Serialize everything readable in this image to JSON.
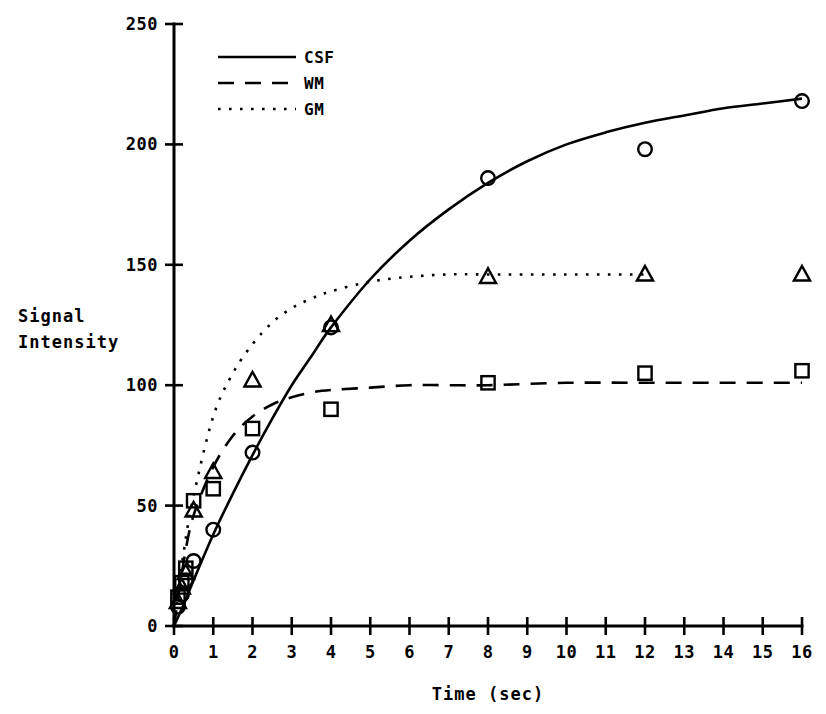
{
  "chart_data": {
    "type": "line",
    "title": "",
    "xlabel": "Time (sec)",
    "ylabel": "Signal\nIntensity",
    "ylabel_line1": "Signal",
    "ylabel_line2": "Intensity",
    "xlim": [
      0,
      16
    ],
    "ylim": [
      0,
      250
    ],
    "xticks": [
      0,
      1,
      2,
      3,
      4,
      5,
      6,
      7,
      8,
      9,
      10,
      11,
      12,
      13,
      14,
      15,
      16
    ],
    "xtick_labels": [
      "0",
      "1",
      "2",
      "3",
      "4",
      "5",
      "6",
      "7",
      "8",
      "9",
      "10",
      "11",
      "12",
      "13",
      "14",
      "15",
      "16"
    ],
    "yticks": [
      0,
      50,
      100,
      150,
      200,
      250
    ],
    "ytick_labels": [
      "0",
      "50",
      "100",
      "150",
      "200",
      "250"
    ],
    "grid": false,
    "legend_position": "upper left",
    "series": [
      {
        "name": "CSF",
        "linestyle": "solid",
        "marker": "circle",
        "color": "#000000",
        "x": [
          0.1,
          0.2,
          0.3,
          0.5,
          1.0,
          2.0,
          4.0,
          8.0,
          12.0,
          16.0
        ],
        "y": [
          8,
          13,
          19,
          27,
          40,
          72,
          124,
          186,
          198,
          218
        ],
        "fit_x": [
          0,
          0.25,
          0.5,
          1,
          1.5,
          2,
          2.5,
          3,
          3.5,
          4,
          5,
          6,
          7,
          8,
          9,
          10,
          11,
          12,
          13,
          14,
          15,
          16
        ],
        "fit_y": [
          0,
          9,
          19,
          38,
          55,
          71,
          86,
          100,
          112,
          124,
          144,
          160,
          173,
          184,
          193,
          200,
          205,
          209,
          212,
          215,
          217,
          219
        ]
      },
      {
        "name": "WM",
        "linestyle": "dashed",
        "marker": "square",
        "color": "#000000",
        "x": [
          0.1,
          0.2,
          0.3,
          0.5,
          1.0,
          2.0,
          4.0,
          8.0,
          12.0,
          16.0
        ],
        "y": [
          12,
          18,
          24,
          52,
          57,
          82,
          90,
          101,
          105,
          106
        ],
        "fit_x": [
          0,
          0.25,
          0.5,
          1,
          1.5,
          2,
          2.5,
          3,
          3.5,
          4,
          5,
          6,
          7,
          8,
          10,
          12,
          14,
          16
        ],
        "fit_y": [
          0,
          27,
          46,
          66,
          79,
          87,
          92,
          95,
          97,
          98,
          99,
          100,
          100,
          100,
          101,
          101,
          101,
          101
        ]
      },
      {
        "name": "GM",
        "linestyle": "dotted",
        "marker": "triangle",
        "color": "#000000",
        "x": [
          0.1,
          0.2,
          0.3,
          0.5,
          1.0,
          2.0,
          4.0,
          8.0,
          12.0,
          16.0
        ],
        "y": [
          10,
          16,
          22,
          48,
          64,
          102,
          125,
          145,
          146,
          146
        ],
        "fit_x": [
          0,
          0.25,
          0.5,
          1,
          1.5,
          2,
          2.5,
          3,
          3.5,
          4,
          5,
          6,
          7,
          8,
          10,
          12,
          14,
          16
        ],
        "fit_y": [
          0,
          31,
          54,
          87,
          105,
          117,
          126,
          132,
          136,
          139,
          143,
          145,
          146,
          146,
          146,
          146,
          146
        ]
      }
    ]
  },
  "legend": {
    "entries": [
      {
        "label": "CSF",
        "style": "solid"
      },
      {
        "label": "WM",
        "style": "dashed"
      },
      {
        "label": "GM",
        "style": "dotted"
      }
    ]
  }
}
